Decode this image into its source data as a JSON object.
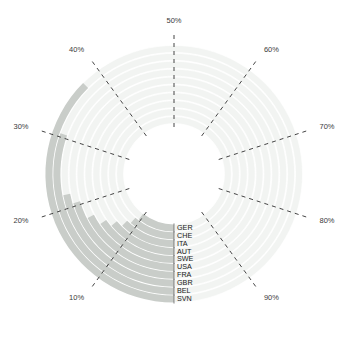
{
  "chart_data": {
    "type": "bar",
    "subtype": "polar-radial-bar",
    "title": "",
    "subtitle": "",
    "xlabel": "",
    "ylabel": "",
    "categories": [
      "SVN",
      "BEL",
      "GBR",
      "FRA",
      "USA",
      "SWE",
      "AUT",
      "ITA",
      "CHE",
      "GER"
    ],
    "values": [
      37.5,
      30.5,
      22.0,
      20.5,
      17.5,
      15.5,
      14.0,
      12.5,
      11.5,
      10.5
    ],
    "series": [
      {
        "name": "share",
        "values": [
          37.5,
          30.5,
          22.0,
          20.5,
          17.5,
          15.5,
          14.0,
          12.5,
          11.5,
          10.5
        ]
      }
    ],
    "value_suffix": "%",
    "rlim": [
      0,
      100
    ],
    "angular_start_deg": 0,
    "angular_direction": "counterclockwise",
    "tick_labels": [
      "10%",
      "20%",
      "30%",
      "40%",
      "50%",
      "60%",
      "70%",
      "80%",
      "90%"
    ],
    "tick_values": [
      10,
      20,
      30,
      40,
      50,
      60,
      70,
      80,
      90
    ],
    "grid": true,
    "grid_style": "dashed-radial",
    "legend": "none",
    "legend_position": "none",
    "colors": {
      "bar_fill": "#c9cdc9",
      "track_fill": "#f2f4f2",
      "grid_line": "#444444",
      "tick_label": "#3a3a3a",
      "category_label": "#1a1a1a",
      "background": "#ffffff"
    },
    "annotations": []
  },
  "geometry": {
    "center_x": 174,
    "center_y": 174,
    "inner_radius": 50,
    "outer_radius": 129
  }
}
